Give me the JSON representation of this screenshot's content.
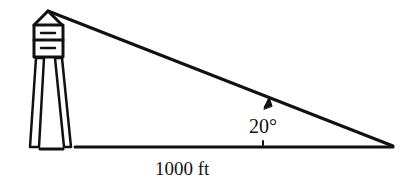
{
  "diagram": {
    "angle_label": "20°",
    "distance_label": "1000 ft",
    "stroke_color": "#111111",
    "background": "#ffffff"
  }
}
